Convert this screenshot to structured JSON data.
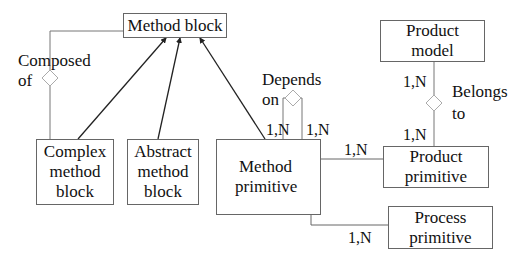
{
  "diagram": {
    "entities": {
      "method_block": "Method block",
      "complex_method_block": "Complex method block",
      "abstract_method_block": "Abstract method block",
      "method_primitive": "Method primitive",
      "product_model": "Product model",
      "product_primitive": "Product primitive",
      "process_primitive": "Process primitive"
    },
    "entity_lines": {
      "complex_method_block": [
        "Complex",
        "method",
        "block"
      ],
      "abstract_method_block": [
        "Abstract",
        "method",
        "block"
      ],
      "method_primitive": [
        "Method",
        "primitive"
      ],
      "product_model": [
        "Product",
        "model"
      ],
      "product_primitive": [
        "Product",
        "primitive"
      ],
      "process_primitive": [
        "Process",
        "primitive"
      ]
    },
    "relationships": {
      "composed_of": [
        "Composed",
        "of"
      ],
      "depends_on": [
        "Depends",
        "on"
      ],
      "belongs_to": [
        "Belongs",
        "to"
      ]
    },
    "cardinalities": {
      "depends_on_left": "1,N",
      "depends_on_right": "1,N",
      "method_to_product_primitive": "1,N",
      "method_to_process_primitive": "1,N",
      "belongs_to_top": "1,N",
      "belongs_to_bottom": "1,N"
    },
    "colors": {
      "line": "#666666",
      "arrow": "#222222",
      "text": "#111111",
      "background": "#ffffff"
    }
  }
}
